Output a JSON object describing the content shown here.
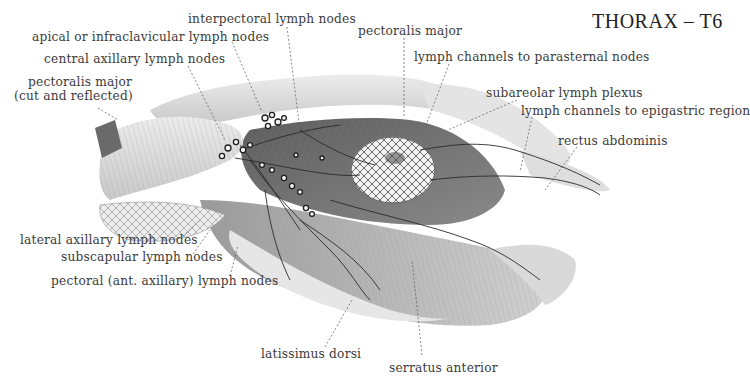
{
  "figure": {
    "title": "THORAX – T6",
    "labels": {
      "interpectoral": "interpectoral lymph nodes",
      "apical": "apical or infraclavicular lymph nodes",
      "central": "central axillary lymph nodes",
      "pect_major_cut_1": "pectoralis major",
      "pect_major_cut_2": "(cut and reflected)",
      "pect_major": "pectoralis major",
      "parasternal": "lymph channels to parasternal nodes",
      "subareolar": "subareolar lymph plexus",
      "epigastric": "lymph channels to epigastric region",
      "rectus": "rectus abdominis",
      "lateral": "lateral axillary lymph nodes",
      "subscapular": "subscapular lymph nodes",
      "pectoral": "pectoral (ant. axillary) lymph nodes",
      "latissimus": "latissimus dorsi",
      "serratus": "serratus anterior"
    },
    "colors": {
      "ink": "#3b3b3b",
      "muscle_dark": "#6e6e6e",
      "muscle_mid": "#a9a9a9",
      "muscle_light": "#dcdcdc",
      "vessel": "#2a2a2a"
    }
  }
}
